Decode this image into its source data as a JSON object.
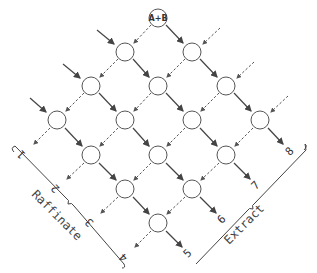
{
  "diagram": {
    "type": "countercurrent-cascade",
    "feed_label": "A+B",
    "raffinate_label": "Raffinate",
    "extract_label": "Extract",
    "raffinate_outlets": [
      "1",
      "2",
      "3",
      "4"
    ],
    "extract_outlets": [
      "5",
      "6",
      "7",
      "8"
    ],
    "stage_rows": [
      1,
      2,
      3,
      4,
      3,
      2,
      1
    ],
    "legend": {
      "solid": "solvent phase (downward right)",
      "dashed": "feed phase (downward left)"
    }
  }
}
